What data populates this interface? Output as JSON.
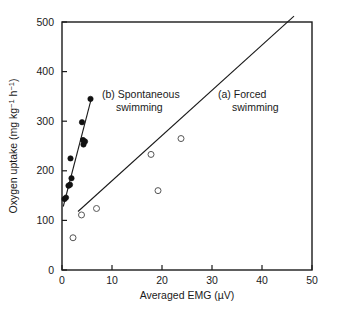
{
  "chart_data": {
    "type": "scatter",
    "title": "",
    "xlabel": "Averaged EMG (µV)",
    "ylabel": "Oxygen uptake (mg kg⁻¹ h⁻¹)",
    "ylabel_parts": {
      "main1": "Oxygen uptake (mg kg",
      "sup1": "−1",
      "main2": " h",
      "sup2": "−1",
      "main3": ")"
    },
    "xlim": [
      0,
      50
    ],
    "ylim": [
      0,
      500
    ],
    "xticks": [
      0,
      10,
      20,
      30,
      40,
      50
    ],
    "yticks": [
      0,
      100,
      200,
      300,
      400,
      500
    ],
    "xtick_labels": [
      "0",
      "10",
      "20",
      "30",
      "40",
      "50"
    ],
    "ytick_labels": [
      "0",
      "100",
      "200",
      "300",
      "400",
      "500"
    ],
    "grid": false,
    "legend_position": "in-plot annotations",
    "frame": "box",
    "series": [
      {
        "name": "(a) Forced swimming",
        "marker": "open-circle",
        "color": "#555555",
        "points": [
          {
            "x": 2.2,
            "y": 65
          },
          {
            "x": 3.9,
            "y": 111
          },
          {
            "x": 6.9,
            "y": 124
          },
          {
            "x": 17.8,
            "y": 233
          },
          {
            "x": 19.2,
            "y": 160
          },
          {
            "x": 23.8,
            "y": 265
          }
        ],
        "fit_line": {
          "x0": 3.2,
          "y0": 118,
          "x1": 46.4,
          "y1": 512
        }
      },
      {
        "name": "(b) Spontaneous swimming",
        "marker": "filled-circle",
        "color": "#111111",
        "points": [
          {
            "x": 0.5,
            "y": 143
          },
          {
            "x": 0.8,
            "y": 146
          },
          {
            "x": 1.3,
            "y": 170
          },
          {
            "x": 1.6,
            "y": 172
          },
          {
            "x": 1.9,
            "y": 185
          },
          {
            "x": 1.7,
            "y": 225
          },
          {
            "x": 4.3,
            "y": 253
          },
          {
            "x": 4.6,
            "y": 259
          },
          {
            "x": 4.2,
            "y": 262
          },
          {
            "x": 4.0,
            "y": 298
          },
          {
            "x": 5.7,
            "y": 345
          }
        ],
        "fit_line": {
          "x0": 0.25,
          "y0": 128,
          "x1": 5.9,
          "y1": 347
        }
      }
    ],
    "annotations": [
      {
        "id": "annot-spontaneous",
        "line1": "(b) Spontaneous",
        "line2": "swimming",
        "x_px": 102,
        "y_px": 98
      },
      {
        "id": "annot-forced",
        "line1": "(a) Forced",
        "line2": "swimming",
        "x_px": 218,
        "y_px": 98
      }
    ]
  },
  "figure": {
    "background_color": "#ffffff",
    "axis_color": "#1a1a1a"
  }
}
